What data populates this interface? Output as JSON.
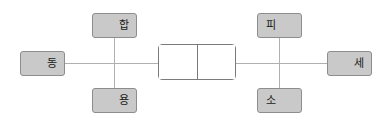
{
  "diagram": {
    "type": "node-link-diagram",
    "canvas": {
      "width": 387,
      "height": 125,
      "background": "#ffffff"
    },
    "colors": {
      "node_fill": "#c9c9c9",
      "node_border": "#8d8d8d",
      "line": "#b0b0b0",
      "center_box_border": "#7a7a7a",
      "center_box_fill": "#ffffff",
      "text": "#1a1a1a"
    },
    "center": {
      "name": "center-box",
      "cells": 2,
      "cell_left_label": "",
      "cell_right_label": ""
    },
    "nodes": {
      "left": {
        "label": "동",
        "position": "left"
      },
      "right": {
        "label": "세",
        "position": "right"
      },
      "top_left": {
        "label": "합",
        "position": "top-left"
      },
      "bottom_left": {
        "label": "용",
        "position": "bottom-left"
      },
      "top_right": {
        "label": "피",
        "position": "top-right"
      },
      "bottom_right": {
        "label": "소",
        "position": "bottom-right"
      }
    }
  }
}
